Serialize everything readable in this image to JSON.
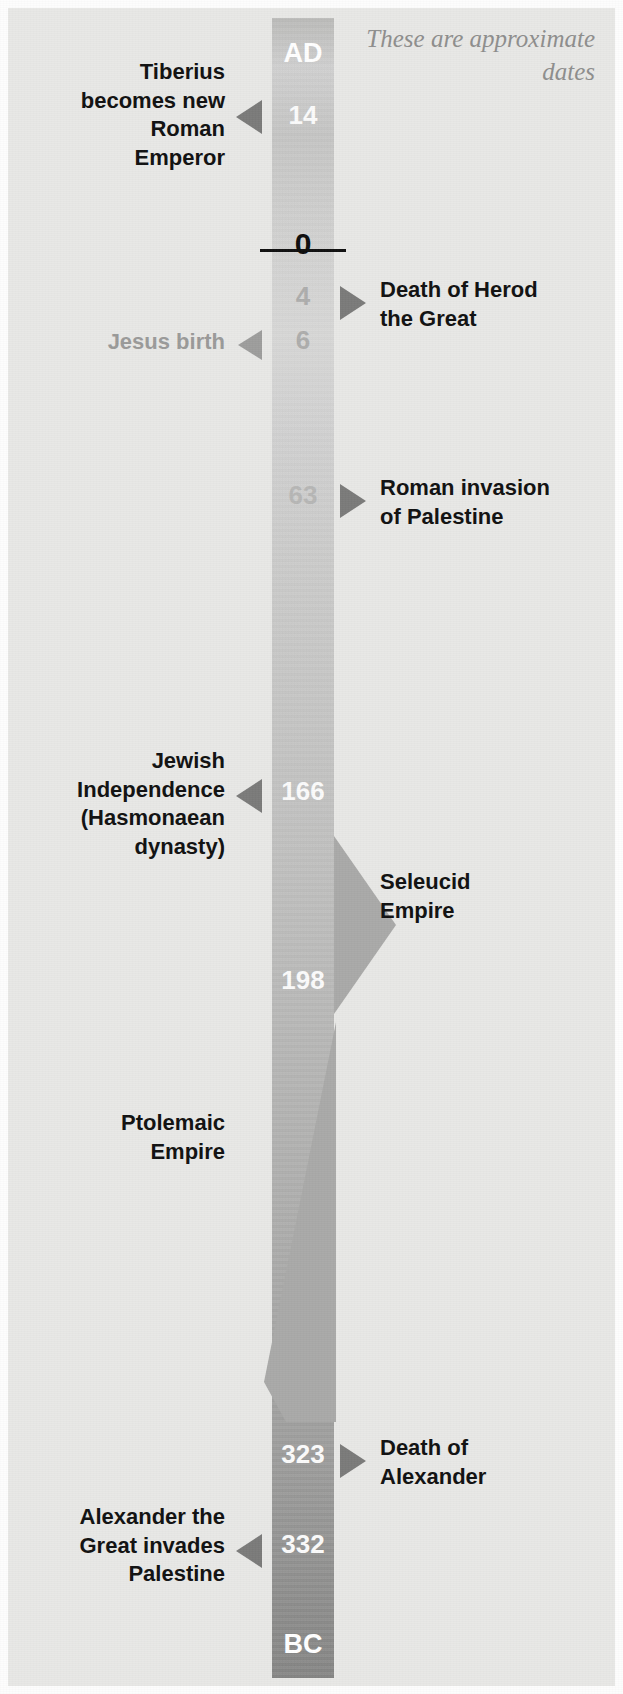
{
  "figure": {
    "type": "timeline",
    "orientation": "vertical",
    "note": "These are approximate dates",
    "era_top_label": "AD",
    "era_bottom_label": "BC",
    "zero_label": "0",
    "colors": {
      "background": "#e8e8e6",
      "bar_top": "#cecece",
      "bar_bottom": "#848483",
      "arrow_dark": "#7a7a79",
      "arrow_light": "#9d9d9c",
      "text_dark": "#101010",
      "text_muted": "#9a9a99",
      "date_on_bar_white": "#fbfbfb",
      "date_on_bar_gray": "#adadac",
      "wedge": "#a9a9a8"
    }
  },
  "events": [
    {
      "id": "tiberius",
      "date": "14",
      "date_style": "white",
      "era": "AD",
      "side": "left",
      "arrow": "left-dark",
      "label_lines": [
        "Tiberius",
        "becomes new",
        "Roman",
        "Emperor"
      ],
      "label": "Tiberius becomes new Roman Emperor"
    },
    {
      "id": "herod-death",
      "date": "4",
      "date_style": "gray",
      "era": "BC",
      "side": "right",
      "arrow": "right-dark",
      "label_lines": [
        "Death of Herod",
        "the Great"
      ],
      "label": "Death of Herod the Great"
    },
    {
      "id": "jesus-birth",
      "date": "6",
      "date_style": "gray",
      "era": "BC",
      "side": "left",
      "arrow": "left-light",
      "label_lines": [
        "Jesus birth"
      ],
      "label": "Jesus birth",
      "muted": true
    },
    {
      "id": "roman-invasion",
      "date": "63",
      "date_style": "gray",
      "era": "BC",
      "side": "right",
      "arrow": "right-dark",
      "label_lines": [
        "Roman invasion",
        "of Palestine"
      ],
      "label": "Roman invasion of Palestine"
    },
    {
      "id": "jewish-independence",
      "date": "166",
      "date_style": "white",
      "era": "BC",
      "side": "left",
      "arrow": "left-dark",
      "label_lines": [
        "Jewish",
        "Independence",
        "(Hasmonaean",
        "dynasty)"
      ],
      "label": "Jewish Independence (Hasmonaean dynasty)"
    },
    {
      "id": "marker-198",
      "date": "198",
      "date_style": "white",
      "era": "BC",
      "side": "none",
      "arrow": "none",
      "label_lines": [],
      "label": ""
    },
    {
      "id": "alexander-death",
      "date": "323",
      "date_style": "white",
      "era": "BC",
      "side": "right",
      "arrow": "right-dark",
      "label_lines": [
        "Death of",
        "Alexander"
      ],
      "label": "Death of Alexander"
    },
    {
      "id": "alexander-invades",
      "date": "332",
      "date_style": "white",
      "era": "BC",
      "side": "left",
      "arrow": "left-dark",
      "label_lines": [
        "Alexander the",
        "Great invades",
        "Palestine"
      ],
      "label": "Alexander the Great invades Palestine"
    }
  ],
  "periods": [
    {
      "id": "seleucid",
      "label_lines": [
        "Seleucid",
        "Empire"
      ],
      "label": "Seleucid Empire",
      "side": "right",
      "from_date": "198",
      "to_date": "166"
    },
    {
      "id": "ptolemaic",
      "label_lines": [
        "Ptolemaic",
        "Empire"
      ],
      "label": "Ptolemaic Empire",
      "side": "left",
      "from_date": "323",
      "to_date": "198"
    }
  ]
}
